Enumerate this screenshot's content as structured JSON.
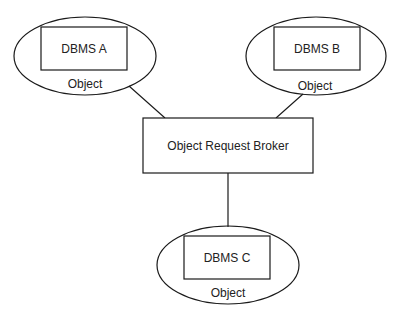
{
  "diagram": {
    "type": "architecture",
    "broker": {
      "label": "Object Request Broker"
    },
    "objects": [
      {
        "id": "a",
        "label": "DBMS A",
        "caption": "Object"
      },
      {
        "id": "b",
        "label": "DBMS B",
        "caption": "Object"
      },
      {
        "id": "c",
        "label": "DBMS C",
        "caption": "Object"
      }
    ],
    "connections": [
      {
        "from": "a",
        "to": "broker"
      },
      {
        "from": "b",
        "to": "broker"
      },
      {
        "from": "c",
        "to": "broker"
      }
    ]
  }
}
